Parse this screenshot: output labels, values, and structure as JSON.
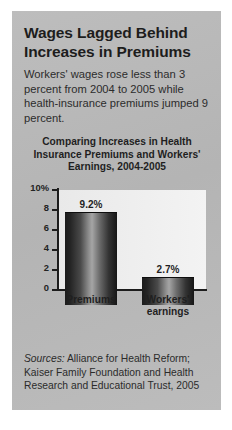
{
  "headline": "Wages Lagged Behind Increases in Premiums",
  "deck": "Workers' wages rose less than 3 percent from 2004 to 2005 while health-insurance premiums jumped 9 percent.",
  "sources": {
    "lead": "Sources:",
    "text": " Alliance for Health Reform; Kaiser Family Foundation and Health Research and Educational Trust, 2005"
  },
  "colors": {
    "panel": "#b9b9b9",
    "bar_dark": "#1b1b1b",
    "bar_highlight": "#a5a5a5",
    "axis": "#1c1c1c",
    "text": "#1f1f1f"
  },
  "chart_data": {
    "type": "bar",
    "title": "Comparing Increases in Health Insurance Premiums and Workers' Earnings, 2004-2005",
    "categories": [
      "Premiums",
      "Workers' earnings"
    ],
    "values": [
      9.2,
      2.7
    ],
    "value_labels": [
      "9.2%",
      "2.7%"
    ],
    "xlabel": "",
    "ylabel": "",
    "ylim": [
      0,
      10
    ],
    "yticks": [
      0,
      2,
      4,
      6,
      8,
      10
    ],
    "ytick_labels": [
      "0",
      "2",
      "4",
      "6",
      "8",
      "10%"
    ],
    "grid": false,
    "legend": false
  }
}
